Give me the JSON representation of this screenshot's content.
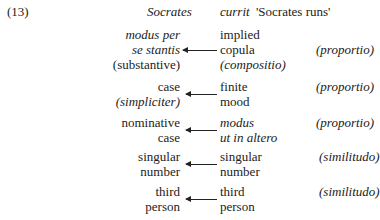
{
  "example_number": "(13)",
  "header": {
    "subject": "Socrates",
    "verb": "currit",
    "gloss": "'Socrates runs'"
  },
  "rows": [
    {
      "left": [
        "modus per",
        "se stantis",
        "(substantive)"
      ],
      "left_italic": [
        true,
        true,
        false
      ],
      "right": [
        "implied",
        "copula",
        "(compositio)"
      ],
      "right_italic": [
        false,
        false,
        true
      ],
      "relation": "(proportio)"
    },
    {
      "left": [
        "case",
        "(simpliciter)"
      ],
      "left_italic": [
        false,
        true
      ],
      "right": [
        "finite",
        "mood"
      ],
      "right_italic": [
        false,
        false
      ],
      "relation": "(proportio)"
    },
    {
      "left": [
        "nominative",
        "case"
      ],
      "left_italic": [
        false,
        false
      ],
      "right": [
        "modus",
        "ut in altero"
      ],
      "right_italic": [
        true,
        true
      ],
      "relation": "(proportio)"
    },
    {
      "left": [
        "singular",
        "number"
      ],
      "left_italic": [
        false,
        false
      ],
      "right": [
        "singular",
        "number"
      ],
      "right_italic": [
        false,
        false
      ],
      "relation": "(similitudo)"
    },
    {
      "left": [
        "third",
        "person"
      ],
      "left_italic": [
        false,
        false
      ],
      "right": [
        "third",
        "person"
      ],
      "right_italic": [
        false,
        false
      ],
      "relation": "(similitudo)"
    }
  ]
}
